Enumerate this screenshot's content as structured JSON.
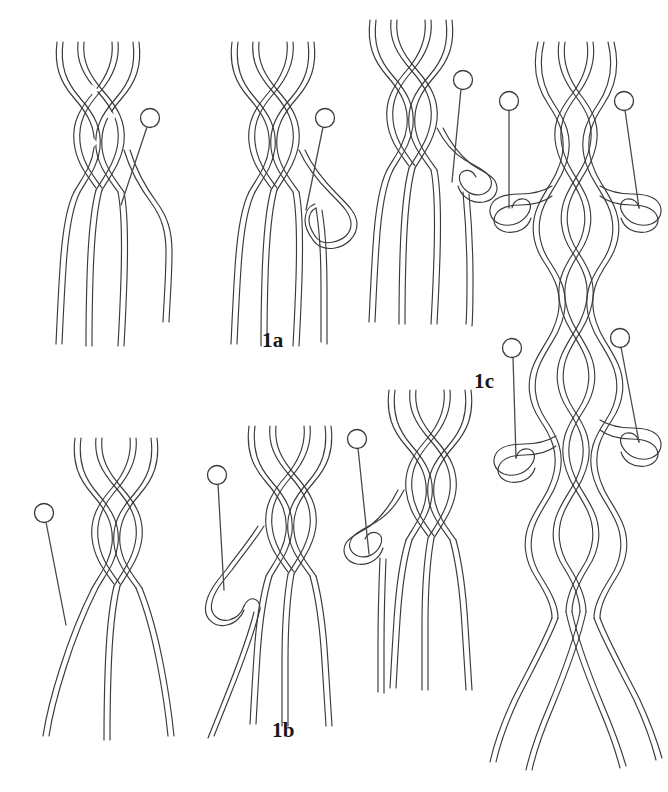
{
  "figure": {
    "background_color": "#ffffff",
    "line_color": "#3a3a3c",
    "width": 668,
    "height": 792
  },
  "labels": [
    {
      "id": "label-1a",
      "text": "1a",
      "x": 262,
      "y": 347
    },
    {
      "id": "label-1b",
      "text": "1b",
      "x": 272,
      "y": 737
    },
    {
      "id": "label-1c",
      "text": "1c",
      "x": 474,
      "y": 388
    }
  ],
  "panels": [
    {
      "id": "panel-1a",
      "label": "1a",
      "caption_text": "1a",
      "steps": [
        {
          "id": "step-1a-1",
          "index": 1,
          "pins": 1,
          "braid_rows": 4,
          "strands": 6,
          "description": "braid with loose strands and a pin placed at right"
        },
        {
          "id": "step-1a-2",
          "index": 2,
          "pins": 1,
          "braid_rows": 4,
          "strands": 6,
          "description": "right strand carried out and bent back toward the pin"
        },
        {
          "id": "step-1a-3",
          "index": 3,
          "pins": 1,
          "braid_rows": 4,
          "strands": 6,
          "description": "strand looped around the pin and returned into the braid"
        }
      ]
    },
    {
      "id": "panel-1b",
      "label": "1b",
      "caption_text": "1b",
      "steps": [
        {
          "id": "step-1b-1",
          "index": 1,
          "pins": 1,
          "braid_rows": 4,
          "strands": 6,
          "description": "braid with a pin placed at left of the loose strands"
        },
        {
          "id": "step-1b-2",
          "index": 2,
          "pins": 1,
          "braid_rows": 4,
          "strands": 6,
          "description": "left strand carried out and bent back toward the pin"
        },
        {
          "id": "step-1b-3",
          "index": 3,
          "pins": 1,
          "braid_rows": 4,
          "strands": 6,
          "description": "strand looped around the pin and returned into the braid"
        }
      ]
    },
    {
      "id": "panel-1c",
      "label": "1c",
      "caption_text": "1c",
      "steps": [
        {
          "id": "step-1c-1",
          "index": 1,
          "pins": 4,
          "braid_rows": 12,
          "strands": 8,
          "description": "completed long braid with two pairs of pinned side loops and strands splayed at the bottom"
        }
      ]
    }
  ],
  "pins": [
    {
      "id": "pin-1a-1",
      "panel": "1a",
      "head_x": 150,
      "head_y": 118,
      "tip_x": 121,
      "tip_y": 204,
      "looped": false
    },
    {
      "id": "pin-1a-2",
      "panel": "1a",
      "head_x": 325,
      "head_y": 118,
      "tip_x": 305,
      "tip_y": 206,
      "looped": true
    },
    {
      "id": "pin-1a-3",
      "panel": "1a",
      "head_x": 463,
      "head_y": 80,
      "tip_x": 452,
      "tip_y": 182,
      "looped": true
    },
    {
      "id": "pin-1b-1",
      "panel": "1b",
      "head_x": 43,
      "head_y": 513,
      "tip_x": 63,
      "tip_y": 625,
      "looped": false
    },
    {
      "id": "pin-1b-2",
      "panel": "1b",
      "head_x": 217,
      "head_y": 479,
      "tip_x": 224,
      "tip_y": 593,
      "looped": true
    },
    {
      "id": "pin-1b-3",
      "panel": "1b",
      "head_x": 357,
      "head_y": 444,
      "tip_x": 365,
      "tip_y": 556,
      "looped": true
    },
    {
      "id": "pin-1c-1",
      "panel": "1c",
      "head_x": 509,
      "head_y": 101,
      "tip_x": 509,
      "tip_y": 200,
      "looped": true
    },
    {
      "id": "pin-1c-2",
      "panel": "1c",
      "head_x": 624,
      "head_y": 101,
      "tip_x": 622,
      "tip_y": 200,
      "looped": true
    },
    {
      "id": "pin-1c-3",
      "panel": "1c",
      "head_x": 513,
      "head_y": 348,
      "tip_x": 513,
      "tip_y": 452,
      "looped": true
    },
    {
      "id": "pin-1c-4",
      "panel": "1c",
      "head_x": 621,
      "head_y": 338,
      "tip_x": 620,
      "tip_y": 432,
      "looped": true
    }
  ]
}
